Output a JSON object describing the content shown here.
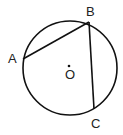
{
  "diagram": {
    "type": "circle-geometry",
    "stroke_color": "#111111",
    "circle": {
      "cx": 70,
      "cy": 68,
      "r": 47
    },
    "center": {
      "label": "O",
      "x": 69,
      "y": 66
    },
    "points": [
      {
        "label": "A",
        "x": 23,
        "y": 59
      },
      {
        "label": "B",
        "x": 89,
        "y": 22
      },
      {
        "label": "C",
        "x": 94,
        "y": 109
      }
    ],
    "segments": [
      [
        "A",
        "B"
      ],
      [
        "B",
        "C"
      ]
    ]
  }
}
